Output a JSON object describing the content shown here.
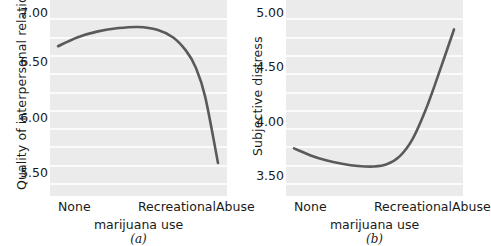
{
  "figure": {
    "caption_a": "(a)",
    "caption_b": "(b)",
    "line_color": "#5a5a5a",
    "plot_bg_color": "#ebebeb",
    "gridline_color": "#fbfbfb"
  },
  "chart_data": [
    {
      "type": "line",
      "panel": "(a)",
      "title": "",
      "ylabel": "Quality of interpersonal relations",
      "xlabel": "marijuana use",
      "categories": [
        "None",
        "Recreational",
        "Abuse"
      ],
      "xtick_labels": [
        "None",
        "Recreational",
        "Abuse"
      ],
      "ytick_labels": [
        "7.00",
        "6.50",
        "6.00",
        "5.50"
      ],
      "yticks": [
        7.0,
        6.5,
        6.0,
        5.5
      ],
      "ylim": [
        5.35,
        7.13
      ],
      "grid": true,
      "legend": "none",
      "x": [
        0.0,
        0.12,
        0.25,
        0.38,
        0.5,
        0.62,
        0.72,
        0.8,
        0.86,
        0.92,
        1.0
      ],
      "values": [
        6.71,
        6.79,
        6.845,
        6.875,
        6.885,
        6.86,
        6.79,
        6.67,
        6.52,
        6.25,
        5.65
      ]
    },
    {
      "type": "line",
      "panel": "(b)",
      "title": "",
      "ylabel": "Subjective distress",
      "xlabel": "marijuana use",
      "categories": [
        "None",
        "Recreational",
        "Abuse"
      ],
      "xtick_labels": [
        "None",
        "Recreational",
        "Abuse"
      ],
      "ytick_labels": [
        "5.00",
        "4.50",
        "4.00",
        "3.50"
      ],
      "yticks": [
        5.0,
        4.5,
        4.0,
        3.5
      ],
      "ylim": [
        3.36,
        5.09
      ],
      "grid": true,
      "legend": "none",
      "x": [
        0.0,
        0.1,
        0.2,
        0.3,
        0.4,
        0.5,
        0.58,
        0.66,
        0.74,
        0.82,
        0.9,
        1.0
      ],
      "values": [
        3.78,
        3.72,
        3.675,
        3.645,
        3.625,
        3.62,
        3.64,
        3.71,
        3.86,
        4.11,
        4.42,
        4.83
      ]
    }
  ],
  "panels": [
    {
      "id": "a",
      "y_title": "Quality of interpersonal relations",
      "x_title": "marijuana use",
      "caption": "(a)",
      "yticks": [
        {
          "label": "7.00",
          "top": 7
        },
        {
          "label": "6.50",
          "top": 56
        },
        {
          "label": "6.00",
          "top": 112
        },
        {
          "label": "5.50",
          "top": 167
        }
      ],
      "xticks": [
        {
          "label": "None",
          "left": 8
        },
        {
          "label": "Recreational",
          "left": 88
        },
        {
          "label": "Abuse",
          "left": 166
        }
      ]
    },
    {
      "id": "b",
      "y_title": "Subjective distress",
      "x_title": "marijuana use",
      "caption": "(b)",
      "yticks": [
        {
          "label": "5.00",
          "top": 7
        },
        {
          "label": "4.50",
          "top": 61
        },
        {
          "label": "4.00",
          "top": 116
        },
        {
          "label": "3.50",
          "top": 170
        }
      ],
      "xticks": [
        {
          "label": "None",
          "left": 8
        },
        {
          "label": "Recreational",
          "left": 88
        },
        {
          "label": "Abuse",
          "left": 166
        }
      ]
    }
  ]
}
